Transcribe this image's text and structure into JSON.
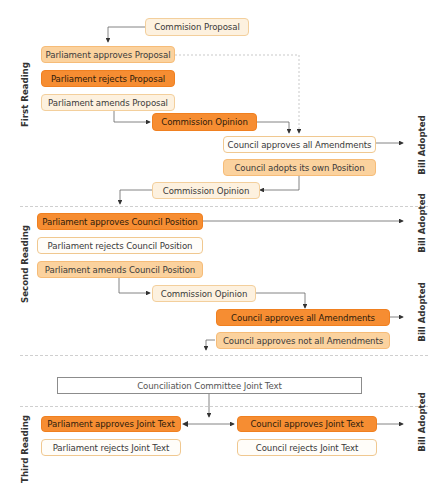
{
  "sections": {
    "first_reading": "First Reading",
    "second_reading": "Second Reading",
    "third_reading": "Third Reading"
  },
  "outcomes": {
    "bill_adopted_1": "Bill Adopted",
    "bill_adopted_2": "Bill Adopted",
    "bill_adopted_3": "Bill Adopted",
    "bill_adopted_4": "Bill Adopted"
  },
  "first": {
    "commission_proposal": "Commision Proposal",
    "parl_approves": "Parliament approves Proposal",
    "parl_rejects": "Parliament rejects Proposal",
    "parl_amends": "Parliament amends Proposal",
    "commission_opinion": "Commission Opinion",
    "council_approves_all": "Council approves all Amendments",
    "council_own_position": "Council adopts its own Position",
    "commission_opinion_2": "Commission Opinion"
  },
  "second": {
    "parl_approves": "Parliament approves Council Position",
    "parl_rejects": "Parliament rejects Council Position",
    "parl_amends": "Parliament amends Council Position",
    "commission_opinion": "Commission Opinion",
    "council_approves_all": "Council approves all Amendments",
    "council_not_all": "Council approves not all Amendments"
  },
  "third": {
    "conciliation": "Counciliation Committee Joint Text",
    "parl_approves": "Parliament approves Joint Text",
    "parl_rejects": "Parliament rejects Joint Text",
    "council_approves": "Council approves Joint Text",
    "council_rejects": "Council rejects Joint Text"
  },
  "colors": {
    "light": "#fdf1df",
    "mid": "#fbd29e",
    "dark": "#f68d32",
    "line": "#555555"
  }
}
